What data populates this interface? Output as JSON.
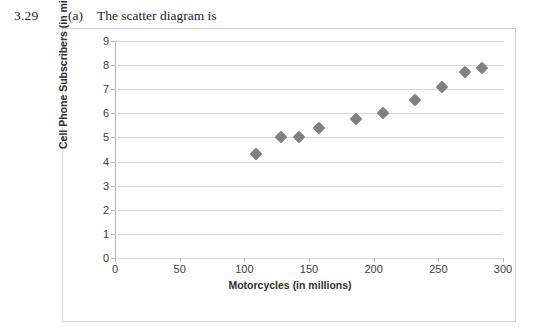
{
  "header": {
    "problem_number": "3.29",
    "part_label": "(a)",
    "text": "The scatter diagram is"
  },
  "chart_data": {
    "type": "scatter",
    "title": "",
    "xlabel": "Motorcycles (in millions)",
    "ylabel": "Cell Phone Subscribers (in millions)",
    "xlim": [
      0,
      300
    ],
    "ylim": [
      0,
      9
    ],
    "xticks": [
      "0",
      "50",
      "100",
      "150",
      "200",
      "250",
      "300"
    ],
    "xtick_values": [
      0,
      50,
      100,
      150,
      200,
      250,
      300
    ],
    "yticks": [
      "0",
      "1",
      "2",
      "3",
      "4",
      "5",
      "6",
      "7",
      "8",
      "9"
    ],
    "ytick_values": [
      0,
      1,
      2,
      3,
      4,
      5,
      6,
      7,
      8,
      9
    ],
    "grid": "horizontal",
    "legend": "none",
    "marker_shape": "diamond",
    "marker_color": "#808080",
    "points": [
      {
        "x": 109,
        "y": 4.3
      },
      {
        "x": 128,
        "y": 5.0
      },
      {
        "x": 142,
        "y": 5.0
      },
      {
        "x": 158,
        "y": 5.4
      },
      {
        "x": 186,
        "y": 5.75
      },
      {
        "x": 207,
        "y": 6.0
      },
      {
        "x": 232,
        "y": 6.55
      },
      {
        "x": 253,
        "y": 7.1
      },
      {
        "x": 271,
        "y": 7.7
      },
      {
        "x": 284,
        "y": 7.9
      }
    ]
  },
  "colors": {
    "gridline": "#d9d9d9",
    "axis": "#b7b7b7",
    "frame_border": "#d3d3d3",
    "marker": "#808080",
    "text": "#404040"
  }
}
